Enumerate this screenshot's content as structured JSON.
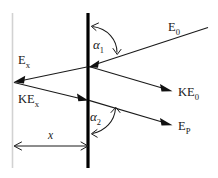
{
  "figure": {
    "type": "ray-diagram",
    "background_color": "#ffffff",
    "line_color": "#1a1a1a",
    "barrier_color": "#000000",
    "ghost_color": "#d2d2d2"
  },
  "labels": {
    "e0": {
      "base": "E",
      "sub": "0"
    },
    "ke0": {
      "base": "KE",
      "sub": "0"
    },
    "ex": {
      "base": "E",
      "sub": "x"
    },
    "kex": {
      "base": "KE",
      "sub": "x"
    },
    "ep": {
      "base": "E",
      "sub": "P"
    },
    "alpha1": {
      "base": "α",
      "sub": "1"
    },
    "alpha2": {
      "base": "α",
      "sub": "2"
    },
    "distance_x": "x"
  },
  "elements": {
    "barrier_name": "vertical-barrier",
    "ghost_name": "left-reference-line",
    "dimension_name": "distance-dimension-x"
  },
  "rays": [
    {
      "name": "incident-ray-e0",
      "label_key": "e0",
      "direction": "down-left",
      "from": [
        208,
        27
      ],
      "to": [
        90,
        66
      ]
    },
    {
      "name": "reflected-ray-ke0",
      "label_key": "ke0",
      "direction": "down-right",
      "from": [
        90,
        66
      ],
      "to": [
        180,
        92
      ]
    },
    {
      "name": "transmitted-ray-ex",
      "label_key": "ex",
      "direction": "left",
      "from": [
        90,
        66
      ],
      "to": [
        14,
        82
      ]
    },
    {
      "name": "incident-ray-kex",
      "label_key": "kex",
      "direction": "down-right",
      "from": [
        14,
        82
      ],
      "to": [
        90,
        100
      ]
    },
    {
      "name": "outgoing-ray-ep",
      "label_key": "ep",
      "direction": "down-right",
      "from": [
        90,
        100
      ],
      "to": [
        180,
        126
      ]
    }
  ],
  "angles": [
    {
      "name": "angle-alpha-1",
      "label_key": "alpha1",
      "vertex": [
        88,
        66
      ],
      "between": "barrier-up and incident-ray-e0"
    },
    {
      "name": "angle-alpha-2",
      "label_key": "alpha2",
      "vertex": [
        88,
        100
      ],
      "between": "barrier-down and outgoing-ray-ep"
    }
  ],
  "dimension": {
    "name": "x-distance",
    "label_key": "distance_x",
    "from_x": 14,
    "to_x": 88,
    "y": 146
  }
}
